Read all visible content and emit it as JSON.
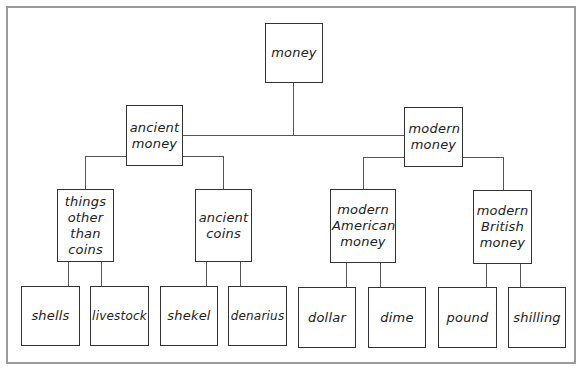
{
  "diagram": {
    "type": "tree",
    "root": {
      "label": "money",
      "children": [
        {
          "label": "ancient money",
          "children": [
            {
              "label": "things other than coins",
              "children": [
                {
                  "label": "shells"
                },
                {
                  "label": "livestock"
                }
              ]
            },
            {
              "label": "ancient coins",
              "children": [
                {
                  "label": "shekel"
                },
                {
                  "label": "denarius"
                }
              ]
            }
          ]
        },
        {
          "label": "modern money",
          "children": [
            {
              "label": "modern American money",
              "children": [
                {
                  "label": "dollar"
                },
                {
                  "label": "dime"
                }
              ]
            },
            {
              "label": "modern British money",
              "children": [
                {
                  "label": "pound"
                },
                {
                  "label": "shilling"
                }
              ]
            }
          ]
        }
      ]
    }
  },
  "nodes": {
    "money": "money",
    "ancient_money": "ancient money",
    "modern_money": "modern money",
    "things_other_than_coins": "things other than coins",
    "ancient_coins": "ancient coins",
    "modern_american_money": "modern American money",
    "modern_british_money": "modern British money",
    "shells": "shells",
    "livestock": "livestock",
    "shekel": "shekel",
    "denarius": "denarius",
    "dollar": "dollar",
    "dime": "dime",
    "pound": "pound",
    "shilling": "shilling"
  },
  "colors": {
    "box_border": "#333333",
    "frame_border": "#9a9a9a",
    "connector": "#555555"
  }
}
